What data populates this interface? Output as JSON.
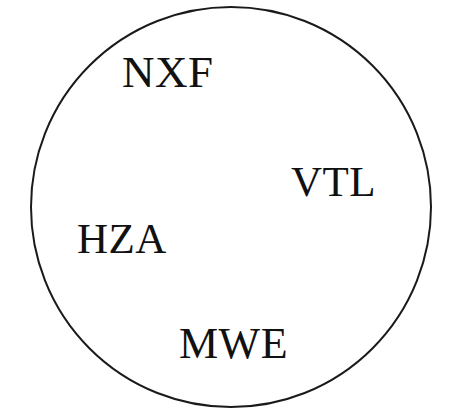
{
  "diagram": {
    "type": "venn-single-set",
    "canvas": {
      "width": 449,
      "height": 409,
      "background_color": "#ffffff"
    },
    "set_boundary": {
      "shape": "circle",
      "center_x": 231,
      "center_y": 207,
      "radius": 200,
      "stroke_color": "#1a1a1a",
      "stroke_width": 2,
      "fill": "none",
      "clipped_at_bottom": true
    },
    "labels": [
      {
        "id": "nxf",
        "text": "NXF",
        "x": 122,
        "y": 50,
        "font_size": 45,
        "color": "#111111",
        "inside_set": true
      },
      {
        "id": "vtl",
        "text": "VTL",
        "x": 291,
        "y": 160,
        "font_size": 43,
        "color": "#111111",
        "inside_set": true
      },
      {
        "id": "hza",
        "text": "HZA",
        "x": 77,
        "y": 217,
        "font_size": 43,
        "color": "#111111",
        "inside_set": true
      },
      {
        "id": "mwe",
        "text": "MWE",
        "x": 179,
        "y": 322,
        "font_size": 44,
        "color": "#111111",
        "inside_set": true
      }
    ]
  }
}
